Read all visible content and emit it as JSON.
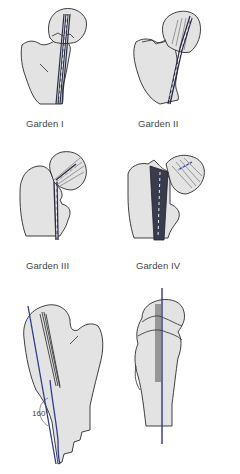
{
  "figure": {
    "panels": [
      {
        "id": "garden-1",
        "label": "Garden I"
      },
      {
        "id": "garden-2",
        "label": "Garden II"
      },
      {
        "id": "garden-3",
        "label": "Garden III"
      },
      {
        "id": "garden-4",
        "label": "Garden IV"
      },
      {
        "id": "ap-view",
        "label": "",
        "angle_annotation": "160°"
      },
      {
        "id": "lateral-view",
        "label": ""
      }
    ],
    "colors": {
      "bone_fill": "#e3e3e3",
      "outline": "#2a2a2a",
      "trabecular_line": "#2b2d45",
      "axis_line": "#2e3a8c",
      "dashed_highlight": "#ffffff"
    }
  }
}
